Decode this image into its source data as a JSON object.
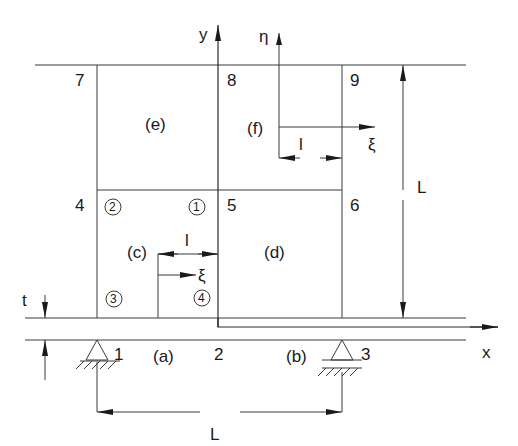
{
  "diagram": {
    "title": "",
    "axes": {
      "x_label": "x",
      "y_label": "y",
      "local_x_label": "ξ",
      "local_y_label": "η"
    },
    "nodes": [
      {
        "id": "1",
        "label": "1"
      },
      {
        "id": "2",
        "label": "2"
      },
      {
        "id": "3",
        "label": "3"
      },
      {
        "id": "4",
        "label": "4"
      },
      {
        "id": "5",
        "label": "5"
      },
      {
        "id": "6",
        "label": "6"
      },
      {
        "id": "7",
        "label": "7"
      },
      {
        "id": "8",
        "label": "8"
      },
      {
        "id": "9",
        "label": "9"
      }
    ],
    "elements": [
      {
        "id": "a",
        "label": "(a)"
      },
      {
        "id": "b",
        "label": "(b)"
      },
      {
        "id": "c",
        "label": "(c)"
      },
      {
        "id": "d",
        "label": "(d)"
      },
      {
        "id": "e",
        "label": "(e)"
      },
      {
        "id": "f",
        "label": "(f)"
      }
    ],
    "local_nodes": [
      {
        "id": "1",
        "label": "1"
      },
      {
        "id": "2",
        "label": "2"
      },
      {
        "id": "3",
        "label": "3"
      },
      {
        "id": "4",
        "label": "4"
      }
    ],
    "dimensions": {
      "span_horizontal": "L",
      "span_vertical": "L",
      "local_length_c": "l",
      "local_length_f": "l",
      "thickness": "t"
    },
    "supports": [
      {
        "node": "1",
        "type": "pin"
      },
      {
        "node": "3",
        "type": "pin"
      }
    ]
  }
}
